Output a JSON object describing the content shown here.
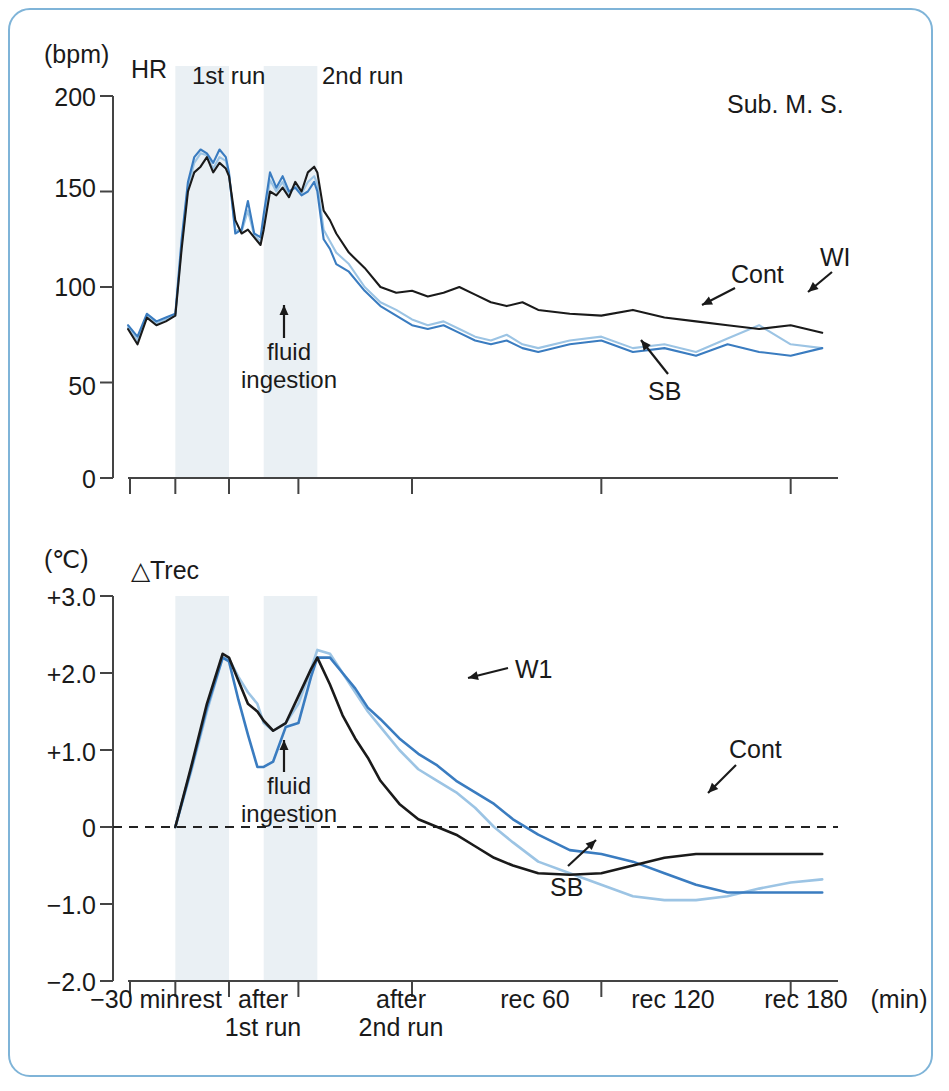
{
  "figure": {
    "subject_label": "Sub. M. S.",
    "frame_color": "#7fb4d8",
    "band_color": "#eaf0f4",
    "series_colors": {
      "Cont": "#1a1a1a",
      "SB": "#3a7cc0",
      "WI": "#9cc4e4"
    }
  },
  "panels": {
    "hr": {
      "unit": "(bpm)",
      "name": "HR",
      "yticks": [
        "200",
        "150",
        "100",
        "50",
        "0"
      ],
      "ylim": [
        0,
        200
      ],
      "run_labels": [
        "1st run",
        "2nd run"
      ],
      "annotation": {
        "line1": "fluid",
        "line2": "ingestion"
      },
      "series_labels": [
        "Cont",
        "WI",
        "SB"
      ]
    },
    "trec": {
      "unit": "(℃)",
      "name": "△Trec",
      "name_prefix": "∠",
      "yticks": [
        "+3.0",
        "+2.0",
        "+1.0",
        "0",
        "−1.0",
        "−2.0"
      ],
      "ylim": [
        -2.0,
        3.0
      ],
      "annotation": {
        "line1": "fluid",
        "line2": "ingestion"
      },
      "series_labels": [
        "W1",
        "Cont",
        "SB"
      ]
    }
  },
  "xaxis": {
    "ticks": [
      {
        "label": "−30 min",
        "line2": ""
      },
      {
        "label": "rest",
        "line2": ""
      },
      {
        "label": "after",
        "line2": "1st run"
      },
      {
        "label": "after",
        "line2": "2nd run"
      },
      {
        "label": "rec 60",
        "line2": ""
      },
      {
        "label": "rec 120",
        "line2": ""
      },
      {
        "label": "rec 180",
        "line2": ""
      }
    ],
    "unit": "(min)"
  },
  "chart_data": {
    "type": "line",
    "panels": [
      {
        "id": "hr",
        "ylabel": "(bpm)",
        "name": "HR",
        "ylim": [
          0,
          200
        ],
        "yticks": [
          0,
          50,
          100,
          150,
          200
        ],
        "xlabel": "(min)",
        "xlim": [
          -30,
          195
        ],
        "grid": false,
        "legend": "in-plot arrow labels",
        "shaded_bands": [
          {
            "label": "1st run",
            "x0": -15,
            "x1": 2
          },
          {
            "label": "2nd run",
            "x0": 13,
            "x1": 30
          }
        ],
        "annotations": [
          {
            "text": "fluid ingestion",
            "x": 7,
            "y": 105,
            "arrow": "up"
          },
          {
            "text": "Cont",
            "x": 150,
            "y": 108,
            "arrow": "down-left"
          },
          {
            "text": "WI",
            "x": 182,
            "y": 118,
            "arrow": "down-left"
          },
          {
            "text": "SB",
            "x": 135,
            "y": 48,
            "arrow": "up-left"
          },
          {
            "text": "Sub. M. S.",
            "x": 160,
            "y": 190,
            "arrow": "none"
          }
        ],
        "series": [
          {
            "name": "Cont",
            "color": "#1a1a1a",
            "x": [
              -30,
              -27,
              -24,
              -21,
              -18,
              -15,
              -13,
              -11,
              -9,
              -7,
              -5,
              -3,
              -1,
              1,
              2,
              4,
              6,
              8,
              10,
              12,
              13,
              15,
              17,
              19,
              21,
              23,
              25,
              27,
              29,
              30,
              32,
              34,
              36,
              40,
              45,
              50,
              55,
              60,
              65,
              70,
              75,
              80,
              85,
              90,
              95,
              100,
              110,
              120,
              130,
              140,
              150,
              160,
              170,
              180,
              190
            ],
            "values": [
              78,
              70,
              84,
              80,
              82,
              85,
              120,
              150,
              160,
              163,
              168,
              160,
              165,
              162,
              158,
              135,
              128,
              130,
              126,
              122,
              130,
              150,
              148,
              152,
              147,
              155,
              150,
              160,
              163,
              160,
              140,
              135,
              128,
              118,
              110,
              100,
              97,
              98,
              95,
              97,
              100,
              96,
              92,
              90,
              92,
              88,
              86,
              85,
              88,
              84,
              82,
              80,
              78,
              80,
              76
            ]
          },
          {
            "name": "SB",
            "color": "#3a7cc0",
            "x": [
              -30,
              -27,
              -24,
              -21,
              -18,
              -15,
              -13,
              -11,
              -9,
              -7,
              -5,
              -3,
              -1,
              1,
              2,
              4,
              6,
              8,
              10,
              12,
              13,
              15,
              17,
              19,
              21,
              23,
              25,
              27,
              29,
              30,
              32,
              34,
              36,
              40,
              45,
              50,
              55,
              60,
              65,
              70,
              75,
              80,
              85,
              90,
              95,
              100,
              110,
              120,
              130,
              140,
              150,
              160,
              170,
              180,
              190
            ],
            "values": [
              80,
              74,
              86,
              82,
              84,
              86,
              125,
              155,
              168,
              172,
              170,
              165,
              172,
              168,
              160,
              128,
              130,
              145,
              128,
              126,
              138,
              160,
              152,
              158,
              150,
              152,
              148,
              150,
              155,
              150,
              125,
              120,
              112,
              108,
              98,
              90,
              85,
              80,
              78,
              80,
              76,
              72,
              70,
              72,
              68,
              66,
              70,
              72,
              66,
              68,
              64,
              70,
              66,
              64,
              68
            ]
          },
          {
            "name": "WI",
            "color": "#9cc4e4",
            "x": [
              -30,
              -27,
              -24,
              -21,
              -18,
              -15,
              -13,
              -11,
              -9,
              -7,
              -5,
              -3,
              -1,
              1,
              2,
              4,
              6,
              8,
              10,
              12,
              13,
              15,
              17,
              19,
              21,
              23,
              25,
              27,
              29,
              30,
              32,
              34,
              36,
              40,
              45,
              50,
              55,
              60,
              65,
              70,
              75,
              80,
              85,
              90,
              95,
              100,
              110,
              120,
              130,
              140,
              150,
              160,
              170,
              180,
              190
            ],
            "values": [
              79,
              72,
              85,
              81,
              83,
              85,
              122,
              152,
              165,
              170,
              169,
              162,
              168,
              166,
              159,
              130,
              129,
              140,
              127,
              124,
              134,
              156,
              150,
              155,
              148,
              153,
              149,
              155,
              158,
              154,
              130,
              124,
              118,
              112,
              100,
              92,
              88,
              83,
              80,
              82,
              78,
              74,
              72,
              75,
              70,
              68,
              72,
              74,
              68,
              70,
              66,
              73,
              80,
              70,
              68
            ]
          }
        ]
      },
      {
        "id": "trec",
        "ylabel": "(℃)",
        "name": "△Trec",
        "ylim": [
          -2.0,
          3.0
        ],
        "yticks": [
          -2.0,
          -1.0,
          0,
          1.0,
          2.0,
          3.0
        ],
        "xlabel": "(min)",
        "xlim": [
          -30,
          195
        ],
        "grid": false,
        "zero_line": "dashed",
        "shaded_bands": [
          {
            "label": "1st run",
            "x0": -15,
            "x1": 2
          },
          {
            "label": "2nd run",
            "x0": 13,
            "x1": 30
          }
        ],
        "annotations": [
          {
            "text": "fluid ingestion",
            "x": 7,
            "y": 1.1,
            "arrow": "up"
          },
          {
            "text": "W1",
            "x": 72,
            "y": 1.85,
            "arrow": "left"
          },
          {
            "text": "Cont",
            "x": 128,
            "y": 1.1,
            "arrow": "down-left"
          },
          {
            "text": "SB",
            "x": 100,
            "y": -1.05,
            "arrow": "up-right"
          }
        ],
        "series": [
          {
            "name": "Cont",
            "color": "#3a7cc0",
            "x": [
              -15,
              -10,
              -5,
              0,
              2,
              5,
              8,
              11,
              13,
              16,
              20,
              24,
              28,
              30,
              34,
              38,
              42,
              46,
              50,
              56,
              62,
              68,
              74,
              80,
              86,
              92,
              100,
              110,
              120,
              130,
              140,
              150,
              160,
              170,
              180,
              190
            ],
            "values": [
              0.0,
              0.75,
              1.55,
              2.2,
              2.15,
              1.65,
              1.2,
              0.78,
              0.78,
              0.85,
              1.3,
              1.35,
              1.95,
              2.2,
              2.2,
              2.0,
              1.8,
              1.55,
              1.4,
              1.15,
              0.95,
              0.8,
              0.6,
              0.45,
              0.3,
              0.1,
              -0.1,
              -0.3,
              -0.35,
              -0.45,
              -0.6,
              -0.75,
              -0.85,
              -0.85,
              -0.85,
              -0.85
            ]
          },
          {
            "name": "WI",
            "color": "#9cc4e4",
            "x": [
              -15,
              -10,
              -5,
              0,
              2,
              5,
              8,
              11,
              13,
              16,
              20,
              24,
              28,
              30,
              34,
              38,
              42,
              46,
              50,
              56,
              62,
              68,
              74,
              80,
              86,
              92,
              100,
              110,
              120,
              130,
              140,
              150,
              160,
              170,
              180,
              190
            ],
            "values": [
              0.0,
              0.72,
              1.5,
              2.2,
              2.18,
              1.95,
              1.75,
              1.6,
              1.35,
              1.25,
              1.35,
              1.6,
              2.05,
              2.3,
              2.25,
              2.0,
              1.75,
              1.5,
              1.3,
              1.0,
              0.75,
              0.6,
              0.45,
              0.25,
              0.0,
              -0.2,
              -0.45,
              -0.6,
              -0.75,
              -0.9,
              -0.95,
              -0.95,
              -0.9,
              -0.8,
              -0.72,
              -0.68
            ]
          },
          {
            "name": "SB",
            "color": "#1a1a1a",
            "x": [
              -15,
              -10,
              -5,
              0,
              2,
              5,
              8,
              11,
              13,
              16,
              20,
              24,
              28,
              30,
              34,
              38,
              42,
              46,
              50,
              56,
              62,
              68,
              74,
              80,
              86,
              92,
              100,
              110,
              120,
              130,
              140,
              150,
              160,
              170,
              180,
              190
            ],
            "values": [
              0.0,
              0.78,
              1.6,
              2.25,
              2.2,
              1.9,
              1.6,
              1.5,
              1.38,
              1.25,
              1.35,
              1.7,
              2.05,
              2.2,
              1.85,
              1.45,
              1.15,
              0.9,
              0.6,
              0.3,
              0.1,
              0.0,
              -0.1,
              -0.25,
              -0.4,
              -0.5,
              -0.6,
              -0.62,
              -0.6,
              -0.5,
              -0.4,
              -0.35,
              -0.35,
              -0.35,
              -0.35,
              -0.35
            ]
          }
        ]
      }
    ]
  }
}
